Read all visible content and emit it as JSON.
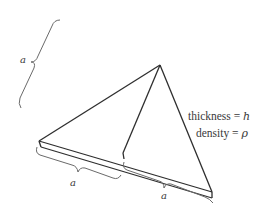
{
  "figure": {
    "labels": {
      "left_dimension": "a",
      "bottom_left_dimension": "a",
      "bottom_right_dimension": "a",
      "thickness_line": "thickness = h",
      "density_line": "density = ρ",
      "thickness_text": "thickness",
      "thickness_symbol": "h",
      "density_text": "density",
      "density_symbol": "ρ",
      "equals": "="
    },
    "colors": {
      "stroke": "#2e2e2e",
      "brace": "#6a6a6a",
      "text": "#3a3a3a",
      "background": "#ffffff"
    }
  }
}
